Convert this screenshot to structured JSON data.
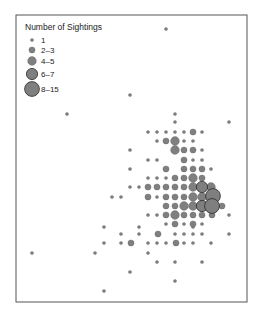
{
  "chart_data": {
    "type": "scatter",
    "title": "",
    "xlabel": "",
    "ylabel": "",
    "grid": false,
    "legend_position": "top-left",
    "legend": {
      "title": "Number of Sightings",
      "entries": [
        {
          "label": "1",
          "r": 1.6
        },
        {
          "label": "2–3",
          "r": 3.1
        },
        {
          "label": "4–5",
          "r": 4.4
        },
        {
          "label": "6–7",
          "r": 5.6
        },
        {
          "label": "8–15",
          "r": 7.4
        }
      ]
    },
    "size_classes": {
      "1": 1.6,
      "2": 3.1,
      "4": 4.4,
      "6": 5.6,
      "8": 7.4
    },
    "colors": {
      "fill": "#7f7f7f",
      "stroke": "#5a5a5a",
      "large_stroke": "#2b2b2b",
      "frame": "#555555"
    },
    "points": [
      {
        "x": 166,
        "y": 29,
        "s": 1
      },
      {
        "x": 130,
        "y": 95,
        "s": 1
      },
      {
        "x": 67,
        "y": 114,
        "s": 1
      },
      {
        "x": 175,
        "y": 114,
        "s": 1
      },
      {
        "x": 175,
        "y": 122,
        "s": 1
      },
      {
        "x": 229,
        "y": 122,
        "s": 1
      },
      {
        "x": 148,
        "y": 132,
        "s": 1
      },
      {
        "x": 157,
        "y": 132,
        "s": 1
      },
      {
        "x": 166,
        "y": 132,
        "s": 1
      },
      {
        "x": 175,
        "y": 132,
        "s": 1
      },
      {
        "x": 184,
        "y": 132,
        "s": 1
      },
      {
        "x": 193,
        "y": 132,
        "s": 2
      },
      {
        "x": 202,
        "y": 132,
        "s": 1
      },
      {
        "x": 157,
        "y": 141,
        "s": 1
      },
      {
        "x": 166,
        "y": 141,
        "s": 2
      },
      {
        "x": 175,
        "y": 141,
        "s": 4
      },
      {
        "x": 184,
        "y": 141,
        "s": 1
      },
      {
        "x": 193,
        "y": 141,
        "s": 1
      },
      {
        "x": 130,
        "y": 150,
        "s": 1
      },
      {
        "x": 175,
        "y": 150,
        "s": 4
      },
      {
        "x": 184,
        "y": 150,
        "s": 2
      },
      {
        "x": 193,
        "y": 150,
        "s": 2
      },
      {
        "x": 202,
        "y": 150,
        "s": 1
      },
      {
        "x": 148,
        "y": 160,
        "s": 1
      },
      {
        "x": 157,
        "y": 160,
        "s": 1
      },
      {
        "x": 184,
        "y": 160,
        "s": 2
      },
      {
        "x": 193,
        "y": 160,
        "s": 1
      },
      {
        "x": 202,
        "y": 160,
        "s": 1
      },
      {
        "x": 130,
        "y": 169,
        "s": 1
      },
      {
        "x": 166,
        "y": 169,
        "s": 2
      },
      {
        "x": 184,
        "y": 169,
        "s": 2
      },
      {
        "x": 193,
        "y": 169,
        "s": 2
      },
      {
        "x": 202,
        "y": 169,
        "s": 2
      },
      {
        "x": 211,
        "y": 169,
        "s": 1
      },
      {
        "x": 148,
        "y": 178,
        "s": 1
      },
      {
        "x": 157,
        "y": 178,
        "s": 1
      },
      {
        "x": 166,
        "y": 178,
        "s": 1
      },
      {
        "x": 175,
        "y": 178,
        "s": 2
      },
      {
        "x": 184,
        "y": 178,
        "s": 2
      },
      {
        "x": 193,
        "y": 178,
        "s": 4
      },
      {
        "x": 202,
        "y": 178,
        "s": 2
      },
      {
        "x": 130,
        "y": 187,
        "s": 1
      },
      {
        "x": 139,
        "y": 187,
        "s": 1
      },
      {
        "x": 148,
        "y": 187,
        "s": 2
      },
      {
        "x": 157,
        "y": 187,
        "s": 2
      },
      {
        "x": 166,
        "y": 187,
        "s": 2
      },
      {
        "x": 175,
        "y": 187,
        "s": 2
      },
      {
        "x": 184,
        "y": 187,
        "s": 2
      },
      {
        "x": 193,
        "y": 187,
        "s": 4
      },
      {
        "x": 202,
        "y": 187,
        "s": 6
      },
      {
        "x": 211,
        "y": 187,
        "s": 4
      },
      {
        "x": 112,
        "y": 197,
        "s": 1
      },
      {
        "x": 121,
        "y": 197,
        "s": 1
      },
      {
        "x": 148,
        "y": 197,
        "s": 2
      },
      {
        "x": 157,
        "y": 197,
        "s": 1
      },
      {
        "x": 166,
        "y": 197,
        "s": 2
      },
      {
        "x": 175,
        "y": 197,
        "s": 2
      },
      {
        "x": 184,
        "y": 197,
        "s": 2
      },
      {
        "x": 193,
        "y": 197,
        "s": 4
      },
      {
        "x": 202,
        "y": 197,
        "s": 4
      },
      {
        "x": 213,
        "y": 196,
        "s": 8
      },
      {
        "x": 166,
        "y": 206,
        "s": 2
      },
      {
        "x": 175,
        "y": 206,
        "s": 2
      },
      {
        "x": 184,
        "y": 206,
        "s": 4
      },
      {
        "x": 193,
        "y": 206,
        "s": 4
      },
      {
        "x": 202,
        "y": 206,
        "s": 6
      },
      {
        "x": 212,
        "y": 206,
        "s": 8
      },
      {
        "x": 222,
        "y": 206,
        "s": 2
      },
      {
        "x": 148,
        "y": 215,
        "s": 1
      },
      {
        "x": 157,
        "y": 215,
        "s": 1
      },
      {
        "x": 166,
        "y": 215,
        "s": 2
      },
      {
        "x": 175,
        "y": 215,
        "s": 4
      },
      {
        "x": 184,
        "y": 215,
        "s": 2
      },
      {
        "x": 193,
        "y": 215,
        "s": 2
      },
      {
        "x": 202,
        "y": 215,
        "s": 2
      },
      {
        "x": 212,
        "y": 215,
        "s": 2
      },
      {
        "x": 166,
        "y": 224,
        "s": 1
      },
      {
        "x": 175,
        "y": 224,
        "s": 2
      },
      {
        "x": 184,
        "y": 224,
        "s": 1
      },
      {
        "x": 193,
        "y": 224,
        "s": 2
      },
      {
        "x": 202,
        "y": 224,
        "s": 1
      },
      {
        "x": 229,
        "y": 215,
        "s": 1
      },
      {
        "x": 104,
        "y": 227,
        "s": 1
      },
      {
        "x": 139,
        "y": 227,
        "s": 1
      },
      {
        "x": 193,
        "y": 227,
        "s": 1
      },
      {
        "x": 121,
        "y": 234,
        "s": 1
      },
      {
        "x": 139,
        "y": 234,
        "s": 1
      },
      {
        "x": 158,
        "y": 234,
        "s": 2
      },
      {
        "x": 175,
        "y": 234,
        "s": 1
      },
      {
        "x": 184,
        "y": 234,
        "s": 1
      },
      {
        "x": 193,
        "y": 234,
        "s": 1
      },
      {
        "x": 202,
        "y": 234,
        "s": 1
      },
      {
        "x": 229,
        "y": 234,
        "s": 1
      },
      {
        "x": 104,
        "y": 243,
        "s": 1
      },
      {
        "x": 121,
        "y": 243,
        "s": 1
      },
      {
        "x": 131,
        "y": 243,
        "s": 2
      },
      {
        "x": 148,
        "y": 243,
        "s": 1
      },
      {
        "x": 157,
        "y": 243,
        "s": 1
      },
      {
        "x": 166,
        "y": 243,
        "s": 1
      },
      {
        "x": 176,
        "y": 243,
        "s": 2
      },
      {
        "x": 184,
        "y": 243,
        "s": 1
      },
      {
        "x": 193,
        "y": 243,
        "s": 1
      },
      {
        "x": 211,
        "y": 243,
        "s": 1
      },
      {
        "x": 32,
        "y": 253,
        "s": 1
      },
      {
        "x": 95,
        "y": 253,
        "s": 1
      },
      {
        "x": 148,
        "y": 253,
        "s": 1
      },
      {
        "x": 157,
        "y": 262,
        "s": 1
      },
      {
        "x": 175,
        "y": 262,
        "s": 1
      },
      {
        "x": 202,
        "y": 262,
        "s": 1
      },
      {
        "x": 130,
        "y": 272,
        "s": 1
      },
      {
        "x": 175,
        "y": 281,
        "s": 1
      },
      {
        "x": 104,
        "y": 291,
        "s": 1
      }
    ],
    "frame": {
      "x": 16,
      "y": 15,
      "width": 231,
      "height": 287
    }
  }
}
